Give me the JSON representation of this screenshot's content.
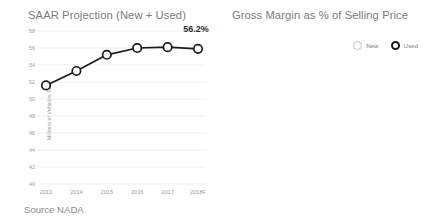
{
  "source_note": "Source NADA",
  "colors": {
    "used_series": "#1a1a1a",
    "new_series": "#c3c3c3",
    "gridline": "#eeeeee",
    "tick_text": "#9a9a9a",
    "title_text": "#7b7b7b",
    "label_text": "#2b2b2b",
    "background": "#ffffff"
  },
  "charts": {
    "saar": {
      "title": "SAAR Projection (New + Used)",
      "ylabel": "Millions of Vehicles Sold",
      "end_label": "56.2%"
    },
    "margin": {
      "title": "Gross Margin as % of Selling Price",
      "legend": [
        {
          "name": "New",
          "label": "New"
        },
        {
          "name": "Used",
          "label": "Used"
        }
      ],
      "used_end_label": "11.7%",
      "new_end_label": "2.5%"
    }
  },
  "chart_data": [
    {
      "type": "line",
      "id": "saar-projection",
      "title": "SAAR Projection (New + Used)",
      "xlabel": "",
      "ylabel": "Millions of Vehicles Sold",
      "categories": [
        "2013",
        "2014",
        "2015",
        "2016",
        "2017",
        "2018F"
      ],
      "ylim": [
        40,
        58
      ],
      "ytick_labels": [
        "40",
        "42",
        "44",
        "46",
        "48",
        "50",
        "52",
        "54",
        "56",
        "58"
      ],
      "ytick_values": [
        40,
        42,
        44,
        46,
        48,
        50,
        52,
        54,
        56,
        58
      ],
      "grid": true,
      "legend": "none",
      "series": [
        {
          "name": "SAAR (New + Used)",
          "color": "#1a1a1a",
          "marker": "open-circle",
          "values": [
            51.6,
            53.3,
            55.2,
            56.0,
            56.1,
            55.9
          ]
        }
      ],
      "annotations": [
        {
          "text": "56.2%",
          "attached_to": "2018F",
          "position": "above-right"
        }
      ],
      "footnote": "Source NADA"
    },
    {
      "type": "line",
      "id": "gross-margin-pct-of-selling-price",
      "title": "Gross Margin as % of Selling Price",
      "xlabel": "",
      "ylabel": "",
      "categories": [
        "2011",
        "2012",
        "2013",
        "2014",
        "2015",
        "2016",
        "2017"
      ],
      "ylim": [
        0,
        18
      ],
      "ytick_labels": [
        "0%",
        "2%",
        "4%",
        "6%",
        "8%",
        "10%",
        "12%",
        "14%",
        "16%",
        "18%"
      ],
      "ytick_values": [
        0,
        2,
        4,
        6,
        8,
        10,
        12,
        14,
        16,
        18
      ],
      "grid": true,
      "legend": "top-right",
      "series": [
        {
          "name": "Used",
          "color": "#1a1a1a",
          "marker": "open-circle",
          "values": [
            14.0,
            13.5,
            13.2,
            12.8,
            12.5,
            11.9,
            11.5
          ]
        },
        {
          "name": "New",
          "color": "#c3c3c3",
          "marker": "open-circle",
          "values": [
            4.4,
            4.2,
            3.9,
            3.7,
            3.4,
            2.9,
            2.5
          ]
        }
      ],
      "annotations": [
        {
          "text": "11.7%",
          "attached_to": "2017",
          "series": "Used",
          "position": "above-left"
        },
        {
          "text": "2.5%",
          "attached_to": "2017",
          "series": "New",
          "position": "above-left"
        }
      ]
    }
  ]
}
